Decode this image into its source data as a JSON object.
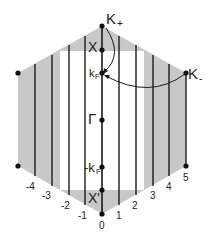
{
  "diagram": {
    "labels": {
      "k_plus": "K",
      "k_plus_sub": "+",
      "k_minus": "K",
      "k_minus_sub": "-",
      "x_point": "X",
      "kf": "k",
      "kf_sub": "F",
      "gamma": "Γ",
      "neg_kf": "-k",
      "neg_kf_sub": "F",
      "x_prime": "X'"
    },
    "line_indices": [
      "-4",
      "-3",
      "-2",
      "-1",
      "0",
      "1",
      "2",
      "3",
      "4",
      "5"
    ],
    "colors": {
      "shade": "#c8c8c8",
      "line": "#1a1a1a",
      "background": "#ffffff"
    }
  }
}
